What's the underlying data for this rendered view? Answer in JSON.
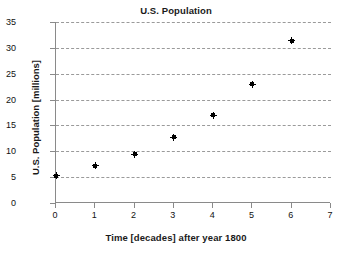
{
  "chart_data": {
    "type": "scatter",
    "title": "U.S. Population",
    "xlabel": "Time [decades] after year 1800",
    "ylabel": "U.S. Population [millions]",
    "xlim": [
      0,
      7
    ],
    "ylim": [
      0,
      35
    ],
    "xticks": [
      0,
      1,
      2,
      3,
      4,
      5,
      6,
      7
    ],
    "yticks": [
      0,
      5,
      10,
      15,
      20,
      25,
      30,
      35
    ],
    "grid": "horizontal-dashed",
    "legend": null,
    "marker": "filled-diamond-plus",
    "marker_color": "#000000",
    "x": [
      0,
      1,
      2,
      3,
      4,
      5,
      6
    ],
    "values": [
      5.3,
      7.2,
      9.4,
      12.7,
      17.0,
      23.0,
      31.4
    ],
    "points": [
      {
        "x": 0,
        "y": 5.3
      },
      {
        "x": 1,
        "y": 7.2
      },
      {
        "x": 2,
        "y": 9.4
      },
      {
        "x": 3,
        "y": 12.7
      },
      {
        "x": 4,
        "y": 17.0
      },
      {
        "x": 5,
        "y": 23.0
      },
      {
        "x": 6,
        "y": 31.4
      }
    ]
  },
  "axis_colors": {
    "axis_line": "#8a8a8a",
    "gridline": "#9a9a9a",
    "text": "#111111",
    "title": "#1a1a1a"
  }
}
